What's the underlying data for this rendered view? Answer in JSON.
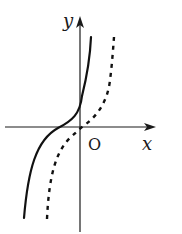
{
  "figure": {
    "axes": {
      "x_label": "x",
      "y_label": "y",
      "origin_label": "O",
      "color": "#1a1a1a"
    },
    "curves": [
      {
        "name": "solid-curve",
        "style": "solid",
        "color": "#111111",
        "path": "M24,218 C28,170 36,140 58,128 C72,121 80,114 82,96 C86,80 90,60 91,37"
      },
      {
        "name": "dashed-curve",
        "style": "dashed",
        "color": "#111111",
        "path": "M47,219 C49,175 56,150 72,136 C78,131 80,128 86,124 C98,115 108,100 110,80 C112,65 113,50 114,37"
      }
    ]
  }
}
